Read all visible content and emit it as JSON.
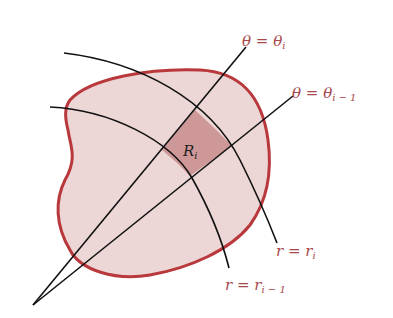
{
  "diagram": {
    "colors": {
      "region_fill": "#ecd6d6",
      "region_stroke": "#b8383c",
      "subregion_fill": "#cf9898",
      "curve_stroke": "#111111",
      "label_color": "#a8484c"
    },
    "labels": {
      "theta_i": {
        "main": "θ = θ",
        "sub": "i"
      },
      "theta_i_minus_1": {
        "main": "θ = θ",
        "sub": "i − 1"
      },
      "r_i": {
        "main": "r = r",
        "sub": "i"
      },
      "r_i_minus_1": {
        "main": "r = r",
        "sub": "i − 1"
      },
      "subregion": {
        "main": "R",
        "sub": "i"
      }
    },
    "elements": [
      "region boundary (closed curve)",
      "ray θ = θ_i from origin",
      "ray θ = θ_{i-1} from origin",
      "arc r = r_i",
      "arc r = r_{i-1}",
      "polar rectangle R_i"
    ]
  }
}
